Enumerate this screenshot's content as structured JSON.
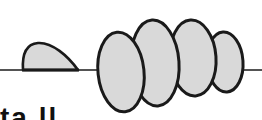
{
  "diagram": {
    "colors": {
      "background": "#ffffff",
      "stroke": "#1a1a1a",
      "fill": "#d9d9d9"
    },
    "baseline": {
      "y": 70,
      "x1": 0,
      "x2": 262
    },
    "half_dome": {
      "x_start": 22,
      "x_end": 78,
      "peak_y": 42
    },
    "ellipses": [
      {
        "cx": 121,
        "cy": 72,
        "rx": 23,
        "ry": 40,
        "rotate": -6
      },
      {
        "cx": 155,
        "cy": 63,
        "rx": 24,
        "ry": 43,
        "rotate": -4
      },
      {
        "cx": 193,
        "cy": 58,
        "rx": 23,
        "ry": 38,
        "rotate": -4
      },
      {
        "cx": 225,
        "cy": 62,
        "rx": 18,
        "ry": 30,
        "rotate": -4
      }
    ],
    "caption_partial": "ta ll"
  }
}
